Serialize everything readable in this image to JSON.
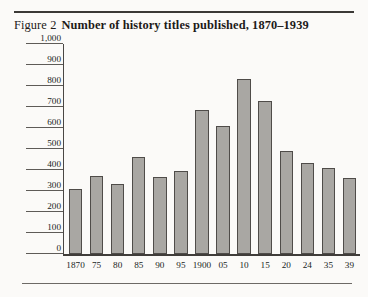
{
  "figure": {
    "label": "Figure 2",
    "title": "Number of history titles published, 1870–1939"
  },
  "chart_data": {
    "type": "bar",
    "title": "Number of history titles published, 1870–1939",
    "xlabel": "",
    "ylabel": "",
    "categories": [
      "1870",
      "75",
      "80",
      "85",
      "90",
      "95",
      "1900",
      "05",
      "10",
      "15",
      "20",
      "24",
      "35",
      "39"
    ],
    "values": [
      310,
      370,
      335,
      460,
      365,
      395,
      685,
      610,
      835,
      730,
      490,
      435,
      410,
      360
    ],
    "ylim": [
      0,
      1000
    ],
    "ytick_values": [
      0,
      100,
      200,
      300,
      400,
      500,
      600,
      700,
      800,
      900,
      1000
    ],
    "ytick_labels": [
      "0",
      "100",
      "200",
      "300",
      "400",
      "500",
      "600",
      "700",
      "800",
      "900",
      "1,000"
    ],
    "grid": false,
    "legend": null,
    "colors": {
      "bar_fill": "#a9a7a3",
      "bar_edge": "#4f4c49",
      "axis": "#403d3a",
      "text": "#201e1c",
      "background": "#fbfaf8"
    }
  }
}
